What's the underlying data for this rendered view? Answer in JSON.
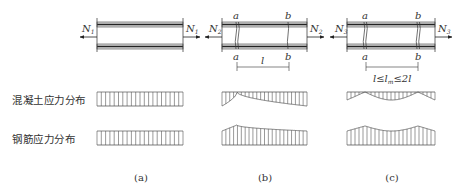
{
  "figure": {
    "row_labels": {
      "concrete": "混凝土应力分布",
      "steel": "钢筋应力分布"
    },
    "panels": [
      {
        "id": "a",
        "caption": "(a)",
        "force_left": "N",
        "force_left_sub": "1",
        "force_right": "N",
        "force_right_sub": "1",
        "sections": [],
        "dimension_label": "",
        "concrete_distribution": "uniform",
        "steel_distribution": "uniform"
      },
      {
        "id": "b",
        "caption": "(b)",
        "force_left": "N",
        "force_left_sub": "2",
        "force_right": "N",
        "force_right_sub": "2",
        "sections": [
          "a",
          "b"
        ],
        "dimension_label": "l",
        "concrete_distribution": "drops to zero at crack a, recovers toward b",
        "steel_distribution": "peak at crack a, decreasing toward b"
      },
      {
        "id": "c",
        "caption": "(c)",
        "force_left": "N",
        "force_left_sub": "3",
        "force_right": "N",
        "force_right_sub": "3",
        "sections": [
          "a",
          "b"
        ],
        "dimension_label": "l≤l",
        "dimension_label_sub": "m",
        "dimension_label_tail": "≤2l",
        "concrete_distribution": "zero at cracks a and b, maximum midway",
        "steel_distribution": "peaks at cracks a and b, minimum midway"
      }
    ],
    "colors": {
      "line": "#333333",
      "bar_fill": "#dcdcdc",
      "hatch": "#555555"
    }
  }
}
